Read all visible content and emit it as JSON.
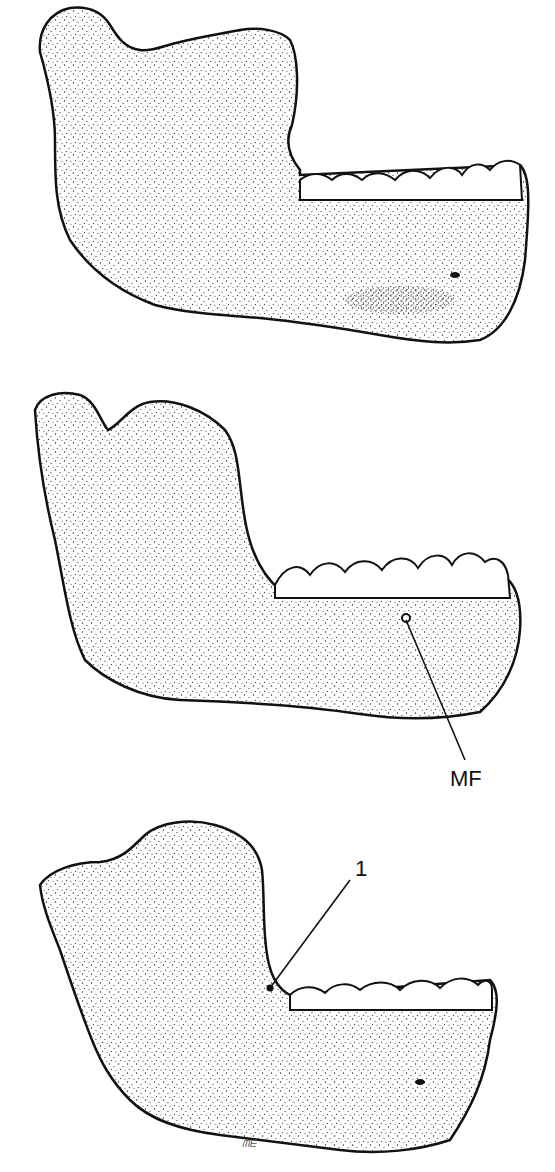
{
  "figure": {
    "type": "scientific-illustration",
    "style": "stippled ink drawing",
    "panels": [
      {
        "id": "top",
        "subject": "mandible, lateral view",
        "labels": []
      },
      {
        "id": "middle",
        "subject": "mandible, lateral view",
        "labels": [
          {
            "text": "MF",
            "meaning": "mental foramen"
          }
        ]
      },
      {
        "id": "bottom",
        "subject": "mandible, lateral view",
        "labels": [
          {
            "text": "1"
          }
        ]
      }
    ],
    "signature": "ᗰᗴ"
  },
  "labels": {
    "mf": "MF",
    "one": "1"
  },
  "colors": {
    "ink": "#111111",
    "background": "#ffffff"
  }
}
